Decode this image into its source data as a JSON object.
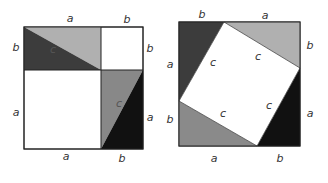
{
  "figure": {
    "colors": {
      "dark": "#3a3a3a",
      "medium": "#888888",
      "light": "#b4b4b4",
      "black": "#111111",
      "white": "#ffffff",
      "stroke": "#222222"
    },
    "left": {
      "labels": {
        "top_a": "a",
        "top_b": "b",
        "left_b": "b",
        "left_a": "a",
        "right_b": "b",
        "right_a": "a",
        "bottom_a": "a",
        "bottom_b": "b",
        "hyp1": "c",
        "hyp2": "c"
      }
    },
    "right": {
      "labels": {
        "top_b": "b",
        "top_a": "a",
        "left_a": "a",
        "left_b": "b",
        "right_b": "b",
        "right_a": "a",
        "bottom_a": "a",
        "bottom_b": "b",
        "c1": "c",
        "c2": "c",
        "c3": "c",
        "c4": "c"
      }
    }
  }
}
